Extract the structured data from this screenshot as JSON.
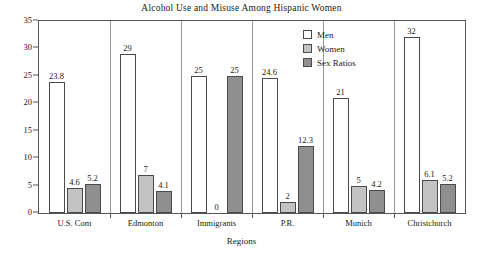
{
  "chart_data": {
    "type": "bar",
    "title": "Alcohol Use and Misuse Among Hispanic Women",
    "xlabel": "Regions",
    "ylabel": "",
    "ylim": [
      0,
      35
    ],
    "ytick_step": 5,
    "yticks": [
      "0",
      "5",
      "10",
      "15",
      "20",
      "25",
      "30",
      "35"
    ],
    "grid": false,
    "legend_position": "top-right",
    "categories": [
      "U.S. Com",
      "Edmonton",
      "Immigrants",
      "P.R.",
      "Munich",
      "Christchurch"
    ],
    "series": [
      {
        "name": "Men",
        "color": "#ffffff",
        "values": [
          23.8,
          29,
          25,
          24.6,
          21,
          32
        ],
        "labels": [
          "23.8",
          "29",
          "25",
          "24.6",
          "21",
          "32"
        ]
      },
      {
        "name": "Women",
        "color": "#c3c3c3",
        "values": [
          4.6,
          7,
          0,
          2,
          5,
          6.1
        ],
        "labels": [
          "4.6",
          "7",
          "0",
          "2",
          "5",
          "6.1"
        ]
      },
      {
        "name": "Sex Ratios",
        "color": "#8f8f8f",
        "values": [
          5.2,
          4.1,
          25,
          12.3,
          4.2,
          5.2
        ],
        "labels": [
          "5.2",
          "4.1",
          "25",
          "12.3",
          "4.2",
          "5.2"
        ]
      }
    ]
  },
  "legend": {
    "entries": [
      {
        "label": "Men"
      },
      {
        "label": "Women"
      },
      {
        "label": "Sex Ratios"
      }
    ]
  }
}
